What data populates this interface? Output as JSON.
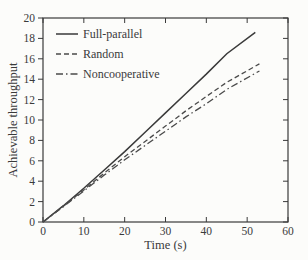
{
  "figure": {
    "background": "#fcfcfa",
    "ink": "#3a3a3a",
    "tick_label_color": "#3a3a3a"
  },
  "chart_data": {
    "type": "line",
    "title": "",
    "xlabel": "Time (s)",
    "ylabel": "Achievable throughput",
    "xlim": [
      0,
      60
    ],
    "ylim": [
      0,
      20
    ],
    "xticks": [
      0,
      10,
      20,
      30,
      40,
      50,
      60
    ],
    "yticks": [
      0,
      2,
      4,
      6,
      8,
      10,
      12,
      14,
      16,
      18,
      20
    ],
    "grid": false,
    "legend_position": "top-left-inside",
    "series": [
      {
        "name": "Full-parallel",
        "style": "solid",
        "color": "#3a3a3a",
        "x": [
          0,
          5,
          10,
          15,
          20,
          25,
          30,
          35,
          40,
          45,
          52
        ],
        "y": [
          0,
          1.6,
          3.3,
          5.1,
          6.9,
          8.8,
          10.7,
          12.6,
          14.5,
          16.5,
          18.6
        ]
      },
      {
        "name": "Random",
        "style": "dashed",
        "color": "#4a4a4a",
        "x": [
          0,
          5,
          10,
          15,
          20,
          25,
          30,
          35,
          40,
          45,
          53
        ],
        "y": [
          0,
          1.55,
          3.15,
          4.8,
          6.4,
          7.9,
          9.4,
          10.9,
          12.3,
          13.7,
          15.5
        ]
      },
      {
        "name": "Noncooperative",
        "style": "dashdot",
        "color": "#4a4a4a",
        "x": [
          0,
          5,
          10,
          15,
          20,
          25,
          30,
          35,
          40,
          45,
          53
        ],
        "y": [
          0,
          1.5,
          3.05,
          4.6,
          6.1,
          7.5,
          8.9,
          10.3,
          11.6,
          13.0,
          14.8
        ]
      }
    ]
  }
}
